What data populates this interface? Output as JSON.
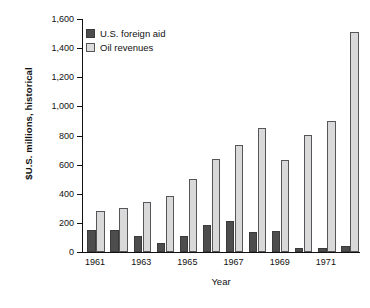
{
  "chart_data": {
    "type": "bar",
    "title": "",
    "xlabel": "Year",
    "ylabel": "$U.S. millions, historical",
    "ylim": [
      0,
      1600
    ],
    "ytick_labels": [
      "0",
      "200",
      "400",
      "600",
      "800",
      "1,000",
      "1,200",
      "1,400",
      "1,600"
    ],
    "ytick_values": [
      0,
      200,
      400,
      600,
      800,
      1000,
      1200,
      1400,
      1600
    ],
    "grid": false,
    "legend_position": "upper-left",
    "categories": [
      "1961",
      "1962",
      "1963",
      "1964",
      "1965",
      "1966",
      "1967",
      "1968",
      "1969",
      "1970",
      "1971",
      "1972"
    ],
    "visible_xtick_labels": [
      "1961",
      "1963",
      "1965",
      "1967",
      "1969",
      "1971"
    ],
    "series": [
      {
        "name": "U.S. foreign aid",
        "color": "#4d4d4d",
        "values": [
          150,
          153,
          110,
          65,
          110,
          188,
          215,
          138,
          143,
          28,
          25,
          38
        ]
      },
      {
        "name": "Oil revenues",
        "color": "#d9d9d9",
        "values": [
          285,
          305,
          345,
          383,
          500,
          638,
          738,
          850,
          635,
          805,
          898,
          1513
        ]
      }
    ]
  },
  "legend": {
    "items": [
      {
        "label": "U.S. foreign aid",
        "swatch": "dark-square-swatch"
      },
      {
        "label": "Oil revenues",
        "swatch": "light-square-swatch"
      }
    ]
  }
}
